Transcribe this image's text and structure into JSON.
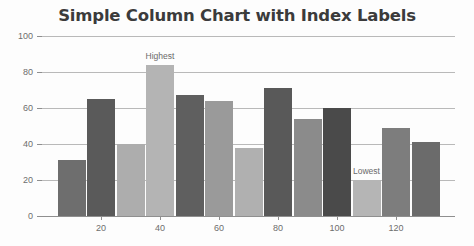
{
  "chart_data": {
    "type": "bar",
    "title": "Simple Column Chart with Index Labels",
    "xlabel": "",
    "ylabel": "",
    "ylim": [
      0,
      100
    ],
    "xlim": [
      0,
      140
    ],
    "grid": true,
    "legend": false,
    "ytick_labels": [
      "0",
      "20",
      "40",
      "60",
      "80",
      "100"
    ],
    "ytick_values": [
      0,
      20,
      40,
      60,
      80,
      100
    ],
    "xtick_labels": [
      "20",
      "40",
      "60",
      "80",
      "100",
      "120"
    ],
    "xtick_values": [
      20,
      40,
      60,
      80,
      100,
      120
    ],
    "x": [
      10,
      20,
      30,
      40,
      50,
      60,
      70,
      80,
      90,
      100,
      110,
      120,
      130
    ],
    "values": [
      31,
      65,
      40,
      84,
      67,
      64,
      38,
      71,
      54,
      60,
      20,
      49,
      41
    ],
    "colors": [
      "#6e6e6e",
      "#5a5a5a",
      "#adadad",
      "#b4b4b4",
      "#5f5f5f",
      "#9a9a9a",
      "#b0b0b0",
      "#595959",
      "#8b8b8b",
      "#4a4a4a",
      "#b5b5b5",
      "#7d7d7d",
      "#6b6b6b"
    ],
    "index_labels": [
      "",
      "",
      "",
      "Highest",
      "",
      "",
      "",
      "",
      "",
      "",
      "Lowest",
      "",
      ""
    ],
    "annotations": [
      {
        "text": "Highest",
        "bar_index": 3,
        "value": 84
      },
      {
        "text": "Lowest",
        "bar_index": 10,
        "value": 20
      }
    ],
    "style": {
      "background": "#fdfdfd",
      "gridline_color": "#b9b9b9",
      "axis_color": "#8f8f8f",
      "title_color": "#3b3b3b",
      "tick_label_color": "#6d6d6d",
      "index_label_color": "#6a6a6a"
    }
  }
}
